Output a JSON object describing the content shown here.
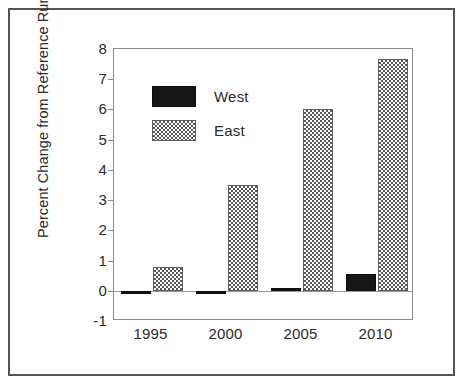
{
  "chart_data": {
    "type": "bar",
    "title": "",
    "xlabel": "",
    "ylabel": "Percent Change from Reference Run",
    "categories": [
      "1995",
      "2000",
      "2005",
      "2010"
    ],
    "series": [
      {
        "name": "West",
        "values": [
          -0.08,
          -0.08,
          0.08,
          0.55
        ],
        "swatch": "solid-black",
        "color": "#171717"
      },
      {
        "name": "East",
        "values": [
          0.8,
          3.5,
          6.0,
          7.67
        ],
        "swatch": "checkered-gray",
        "color": "#595959"
      }
    ],
    "ylim": [
      -1,
      8
    ],
    "ytick_step": 1,
    "yticks": [
      "8",
      "7",
      "6",
      "5",
      "4",
      "3",
      "2",
      "1",
      "0",
      "-1"
    ],
    "grid": false,
    "legend_position": "upper-left-inside",
    "zero_line": true,
    "frame": true
  },
  "legend": {
    "entries": [
      {
        "label": "West"
      },
      {
        "label": "East"
      }
    ]
  },
  "axes": {
    "y_title": "Percent Change from Reference Run"
  }
}
